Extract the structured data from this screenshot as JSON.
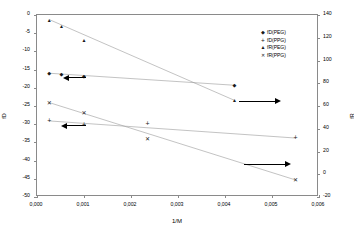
{
  "chart_data": {
    "type": "scatter",
    "title": "",
    "xlabel": "1/M",
    "ylabel_left": "fD",
    "ylabel_right": "fR",
    "xlim": [
      0,
      0.006
    ],
    "ylim_left": [
      -50,
      0
    ],
    "ylim_right": [
      -20,
      140
    ],
    "grid": false,
    "legend_position": "top-right-inside",
    "x_ticks": [
      "0,000",
      "0,001",
      "0,002",
      "0,003",
      "0,004",
      "0,005",
      "0,006"
    ],
    "x_tick_values": [
      0,
      0.001,
      0.002,
      0.003,
      0.004,
      0.005,
      0.006
    ],
    "y_left_ticks": [
      "0",
      "-5",
      "-10",
      "-15",
      "-20",
      "-25",
      "-30",
      "-35",
      "-40",
      "-45",
      "-50"
    ],
    "y_left_tick_values": [
      0,
      -5,
      -10,
      -15,
      -20,
      -25,
      -30,
      -35,
      -40,
      -45,
      -50
    ],
    "y_right_ticks": [
      "140",
      "120",
      "100",
      "80",
      "60",
      "40",
      "20",
      "0",
      "-20"
    ],
    "y_right_tick_values": [
      140,
      120,
      100,
      80,
      60,
      40,
      20,
      0,
      -20
    ],
    "series": [
      {
        "name": "fD(PEG)",
        "marker": "diamond",
        "glyph": "◆",
        "axis": "left",
        "color": "#1a1a1a",
        "x": [
          0.00026,
          0.00052,
          0.001,
          0.0042
        ],
        "y": [
          -16.0,
          -16.1,
          -16.8,
          -19.3
        ]
      },
      {
        "name": "fD(PPG)",
        "marker": "plus",
        "glyph": "+",
        "axis": "left",
        "color": "#1a1a1a",
        "x": [
          0.00026,
          0.001,
          0.00235,
          0.0055
        ],
        "y": [
          -29.1,
          -30.2,
          -29.9,
          -33.8
        ]
      },
      {
        "name": "fR(PEG)",
        "marker": "triangle",
        "glyph": "▲",
        "axis": "right",
        "color": "#1a1a1a",
        "x": [
          0.00026,
          0.00052,
          0.001,
          0.0042
        ],
        "y": [
          136,
          130,
          118,
          65
        ]
      },
      {
        "name": "fR(PPG)",
        "marker": "x",
        "glyph": "✕",
        "axis": "right",
        "color": "#1a1a1a",
        "x": [
          0.00026,
          0.001,
          0.00235,
          0.0055
        ],
        "y": [
          63,
          54,
          31,
          -5
        ]
      }
    ],
    "trend_lines": [
      {
        "series": "fD(PEG)",
        "axis": "left",
        "x0": 0.00026,
        "y0": -16.0,
        "x1": 0.0042,
        "y1": -19.3
      },
      {
        "series": "fD(PPG)",
        "axis": "left",
        "x0": 0.00026,
        "y0": -29.1,
        "x1": 0.0055,
        "y1": -33.8
      },
      {
        "series": "fR(PEG)",
        "axis": "right",
        "x0": 0.00026,
        "y0": 136,
        "x1": 0.0042,
        "y1": 65
      },
      {
        "series": "fR(PPG)",
        "axis": "right",
        "x0": 0.00026,
        "y0": 63,
        "x1": 0.0055,
        "y1": -5
      }
    ],
    "annotations": [
      {
        "name": "arrow-fd-peg-left",
        "direction": "left",
        "axis": "left",
        "x_start": 0.00105,
        "x_end": 0.00055,
        "y": -17.3
      },
      {
        "name": "arrow-fd-ppg-left",
        "direction": "left",
        "axis": "left",
        "x_start": 0.00105,
        "x_end": 0.0005,
        "y": -30.4
      },
      {
        "name": "arrow-fr-peg-right",
        "direction": "right",
        "axis": "right",
        "x_start": 0.0043,
        "x_end": 0.0052,
        "y": 64
      },
      {
        "name": "arrow-fr-ppg-right",
        "direction": "right",
        "axis": "right",
        "x_start": 0.0044,
        "x_end": 0.0054,
        "y": 9
      }
    ]
  },
  "legend": {
    "items": [
      {
        "label": "fD(PEG)",
        "glyph": "◆",
        "cls": "diamond"
      },
      {
        "label": "fD(PPG)",
        "glyph": "+",
        "cls": "plus"
      },
      {
        "label": "fR(PEG)",
        "glyph": "▲",
        "cls": "tri"
      },
      {
        "label": "fR(PPG)",
        "glyph": "✕",
        "cls": "ex"
      }
    ]
  }
}
